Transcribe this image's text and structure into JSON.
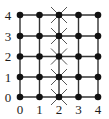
{
  "diagram": {
    "type": "grid-graph",
    "rows": 5,
    "cols": 5,
    "x_labels": [
      "0",
      "1",
      "2",
      "3",
      "4"
    ],
    "y_labels": [
      "0",
      "1",
      "2",
      "3",
      "4"
    ],
    "x_positions": [
      20,
      39.5,
      59,
      78.5,
      98
    ],
    "y_positions": [
      97,
      77,
      56.5,
      36,
      15
    ],
    "marked_column": 2,
    "marker_symbol": "cross",
    "node_symbol": "filled-circle",
    "colors": {
      "line": "#333333",
      "node": "#111111",
      "cross": "#555555",
      "label": "#1a1a1a",
      "background": "#ffffff"
    }
  }
}
